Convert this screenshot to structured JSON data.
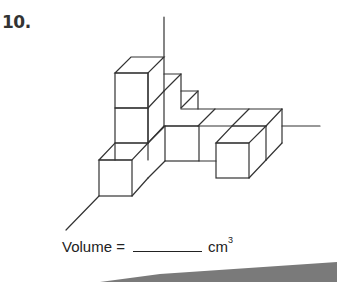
{
  "question": {
    "number": "10.",
    "figure": "isometric-cube-structure",
    "answer_label": "Volume =",
    "answer_value": "",
    "unit": "cm",
    "unit_exponent": "3"
  },
  "colors": {
    "line": "#333333",
    "footer_band": "#7a7a7a"
  }
}
